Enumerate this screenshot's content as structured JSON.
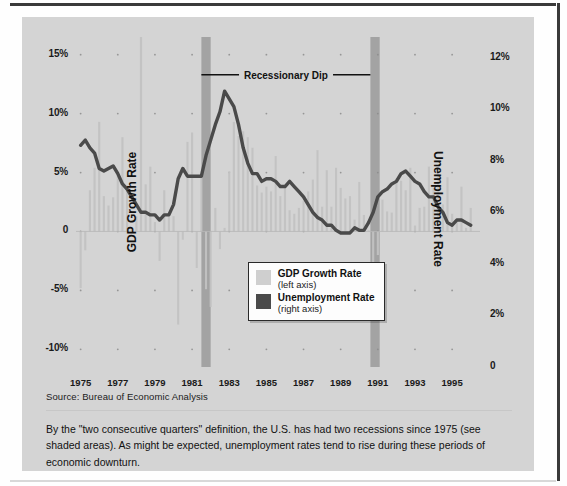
{
  "figure": {
    "source_note": "Source:  Bureau of Economic Analysis",
    "caption": "By the \"two consecutive quarters\" definition, the U.S. has had two recessions since 1975 (see shaded areas). As might be expected, unemployment rates tend to rise during these periods of economic downturn."
  },
  "colors": {
    "panel_background": "#d4d4d4",
    "bar_fill": "#c2c2c2",
    "line_stroke": "#4a4a4a",
    "recession_band": "#9e9e9e",
    "legend_background": "#fdfdfd",
    "text": "#111111",
    "frame_rule": "#3a3a3a"
  },
  "legend": {
    "position": "inside-center",
    "entries": [
      {
        "name": "GDP Growth Rate",
        "axis_note": "(left axis)",
        "swatch_color": "#cfcfcf"
      },
      {
        "name": "Unemployment Rate",
        "axis_note": "(right axis)",
        "swatch_color": "#4a4a4a"
      }
    ]
  },
  "annotations": [
    {
      "label": "Recessionary Dip",
      "from_year": 1981.5,
      "to_year": 1990.6,
      "y_value_left": 13.3
    }
  ],
  "recession_bands": [
    {
      "start_year": 1981.5,
      "end_year": 1982.0
    },
    {
      "start_year": 1990.6,
      "end_year": 1991.1
    }
  ],
  "chart_data": {
    "type": "bar",
    "title": "",
    "subtitle": "",
    "xlabel": "",
    "ylabel": "GDP Growth Rate",
    "y2label": "Unemployment Rate",
    "xlim": [
      1974.75,
      1996.5
    ],
    "ylim": [
      -11.5,
      16.5
    ],
    "y2lim": [
      0,
      12.8
    ],
    "grid": "dotted-intersections",
    "legend_position": "center",
    "x_tick_labels": [
      "1975",
      "1977",
      "1979",
      "1981",
      "1983",
      "1985",
      "1987",
      "1989",
      "1991",
      "1993",
      "1995"
    ],
    "x_tick_values": [
      1975,
      1977,
      1979,
      1981,
      1983,
      1985,
      1987,
      1989,
      1991,
      1993,
      1995
    ],
    "y_tick_labels": [
      "15%",
      "10%",
      "5%",
      "0",
      "-5%",
      "-10%"
    ],
    "y_tick_values": [
      15,
      10,
      5,
      0,
      -5,
      -10
    ],
    "y2_tick_labels": [
      "12%",
      "10%",
      "8%",
      "6%",
      "4%",
      "2%",
      "0"
    ],
    "y2_tick_values": [
      12,
      10,
      8,
      6,
      4,
      2,
      0
    ],
    "series": [
      {
        "name": "GDP Growth Rate",
        "kind": "bar",
        "axis": "left",
        "unit": "%",
        "x": [
          1975.0,
          1975.25,
          1975.5,
          1975.75,
          1976.0,
          1976.25,
          1976.5,
          1976.75,
          1977.0,
          1977.25,
          1977.5,
          1977.75,
          1978.0,
          1978.25,
          1978.5,
          1978.75,
          1979.0,
          1979.25,
          1979.5,
          1979.75,
          1980.0,
          1980.25,
          1980.5,
          1980.75,
          1981.0,
          1981.25,
          1981.5,
          1981.75,
          1982.0,
          1982.25,
          1982.5,
          1982.75,
          1983.0,
          1983.25,
          1983.5,
          1983.75,
          1984.0,
          1984.25,
          1984.5,
          1984.75,
          1985.0,
          1985.25,
          1985.5,
          1985.75,
          1986.0,
          1986.25,
          1986.5,
          1986.75,
          1987.0,
          1987.25,
          1987.5,
          1987.75,
          1988.0,
          1988.25,
          1988.5,
          1988.75,
          1989.0,
          1989.25,
          1989.5,
          1989.75,
          1990.0,
          1990.25,
          1990.5,
          1990.75,
          1991.0,
          1991.25,
          1991.5,
          1991.75,
          1992.0,
          1992.25,
          1992.5,
          1992.75,
          1993.0,
          1993.25,
          1993.5,
          1993.75,
          1994.0,
          1994.25,
          1994.5,
          1994.75,
          1995.0,
          1995.25,
          1995.5,
          1995.75,
          1996.0
        ],
        "values": [
          -4.8,
          -1.6,
          3.5,
          5.4,
          9.3,
          3.0,
          2.2,
          2.9,
          4.8,
          8.0,
          3.9,
          0.1,
          1.3,
          16.5,
          4.0,
          5.5,
          0.8,
          -2.5,
          3.5,
          1.4,
          1.3,
          -7.9,
          -0.7,
          7.6,
          8.4,
          -3.1,
          4.9,
          -4.9,
          -6.4,
          2.0,
          -1.5,
          0.3,
          5.1,
          9.3,
          8.1,
          8.5,
          8.0,
          7.1,
          3.9,
          3.3,
          3.8,
          3.4,
          6.4,
          3.0,
          3.8,
          1.8,
          1.5,
          2.0,
          2.6,
          3.4,
          4.4,
          6.9,
          2.1,
          5.2,
          2.1,
          5.4,
          3.7,
          2.8,
          3.0,
          1.0,
          4.2,
          1.4,
          0.1,
          -3.2,
          -2.0,
          2.7,
          1.7,
          1.6,
          4.5,
          4.3,
          3.5,
          5.4,
          0.5,
          2.0,
          2.1,
          5.5,
          3.7,
          5.3,
          2.3,
          4.6,
          1.5,
          0.8,
          3.8,
          0.3,
          2.0
        ]
      },
      {
        "name": "Unemployment Rate",
        "kind": "line",
        "axis": "right",
        "unit": "%",
        "x": [
          1975.0,
          1975.25,
          1975.5,
          1975.75,
          1976.0,
          1976.25,
          1976.5,
          1976.75,
          1977.0,
          1977.25,
          1977.5,
          1977.75,
          1978.0,
          1978.25,
          1978.5,
          1978.75,
          1979.0,
          1979.25,
          1979.5,
          1979.75,
          1980.0,
          1980.25,
          1980.5,
          1980.75,
          1981.0,
          1981.25,
          1981.5,
          1981.75,
          1982.0,
          1982.25,
          1982.5,
          1982.75,
          1983.0,
          1983.25,
          1983.5,
          1983.75,
          1984.0,
          1984.25,
          1984.5,
          1984.75,
          1985.0,
          1985.25,
          1985.5,
          1985.75,
          1986.0,
          1986.25,
          1986.5,
          1986.75,
          1987.0,
          1987.25,
          1987.5,
          1987.75,
          1988.0,
          1988.25,
          1988.5,
          1988.75,
          1989.0,
          1989.25,
          1989.5,
          1989.75,
          1990.0,
          1990.25,
          1990.5,
          1990.75,
          1991.0,
          1991.25,
          1991.5,
          1991.75,
          1992.0,
          1992.25,
          1992.5,
          1992.75,
          1993.0,
          1993.25,
          1993.5,
          1993.75,
          1994.0,
          1994.25,
          1994.5,
          1994.75,
          1995.0,
          1995.25,
          1995.5,
          1995.75,
          1996.0
        ],
        "values": [
          8.6,
          8.8,
          8.5,
          8.3,
          7.7,
          7.6,
          7.7,
          7.8,
          7.5,
          7.1,
          6.9,
          6.6,
          6.3,
          6.0,
          6.0,
          5.9,
          5.9,
          5.7,
          5.9,
          5.9,
          6.3,
          7.3,
          7.7,
          7.4,
          7.4,
          7.4,
          7.4,
          8.2,
          8.8,
          9.4,
          9.9,
          10.7,
          10.4,
          10.1,
          9.4,
          8.5,
          7.9,
          7.5,
          7.5,
          7.2,
          7.3,
          7.3,
          7.2,
          7.0,
          7.0,
          7.2,
          7.0,
          6.8,
          6.6,
          6.3,
          6.0,
          5.8,
          5.7,
          5.5,
          5.5,
          5.3,
          5.2,
          5.2,
          5.2,
          5.4,
          5.3,
          5.3,
          5.6,
          6.0,
          6.6,
          6.8,
          6.9,
          7.1,
          7.2,
          7.5,
          7.6,
          7.4,
          7.2,
          7.1,
          6.8,
          6.6,
          6.6,
          6.2,
          6.0,
          5.6,
          5.5,
          5.7,
          5.7,
          5.6,
          5.5
        ]
      }
    ]
  }
}
